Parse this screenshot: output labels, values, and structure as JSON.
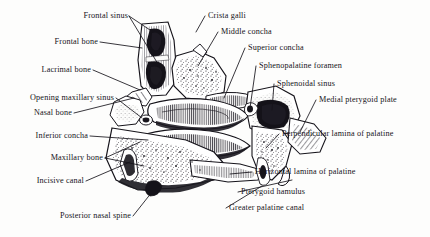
{
  "figure": {
    "kind": "anatomical-illustration",
    "style": "black-and-white engraving / stipple line art",
    "background_color": "#fdfdfc",
    "ink_color": "#15131a"
  },
  "labels_left": [
    {
      "id": "frontal-sinus",
      "text": "Frontal sinus"
    },
    {
      "id": "frontal-bone",
      "text": "Frontal bone"
    },
    {
      "id": "lacrimal-bone",
      "text": "Lacrimal bone"
    },
    {
      "id": "opening-maxillary-sinus",
      "text": "Opening maxillary  sinus"
    },
    {
      "id": "nasal-bone",
      "text": "Nasal bone"
    },
    {
      "id": "inferior-concha",
      "text": "Inferior concha"
    },
    {
      "id": "maxillary-bone",
      "text": "Maxillary bone"
    },
    {
      "id": "incisive-canal",
      "text": "Incisive canal"
    },
    {
      "id": "posterior-nasal-spine",
      "text": "Posterior nasal spine"
    }
  ],
  "labels_right": [
    {
      "id": "crista-galli",
      "text": "Crista galli"
    },
    {
      "id": "middle-concha",
      "text": "Middle concha"
    },
    {
      "id": "superior-concha",
      "text": "Superior concha"
    },
    {
      "id": "sphenopalatine-foramen",
      "text": "Sphenopalatine foramen"
    },
    {
      "id": "sphenoidal-sinus",
      "text": "Sphenoidal sinus"
    },
    {
      "id": "medial-pterygoid-plate",
      "text": "Medial pterygoid plate"
    },
    {
      "id": "perpendicular-lamina-of-palatine",
      "text": "Perpendicular lamina of palatine"
    },
    {
      "id": "horizontal-lamina-of-palatine",
      "text": "Horizontal lamina of palatine"
    },
    {
      "id": "pterygoid-hamulus",
      "text": "Pterygoid hamulus"
    },
    {
      "id": "greater-palatine-canal",
      "text": "Greater palatine canal"
    }
  ]
}
